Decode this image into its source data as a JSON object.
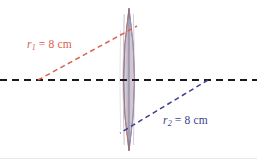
{
  "figure": {
    "background_color": "#ffffff",
    "width": 257,
    "height": 159
  },
  "optical_axis": {
    "name": "optical-axis",
    "style": "dashed",
    "color": "#1a1a1a",
    "y": 80,
    "x_start": 0,
    "x_end": 257
  },
  "lens": {
    "name": "biconvex-lens",
    "shape": "biconvex",
    "center_x": 129,
    "top_y": 8,
    "bottom_y": 151,
    "half_width": 11,
    "fill_color": "#c9c6d6",
    "left_edge_color": "#c4786e",
    "right_edge_color": "#9b93b5",
    "outline_color": "#6e6880"
  },
  "radii": [
    {
      "id": "r1",
      "label": "r",
      "subscript": "1",
      "equals": " = 8 cm",
      "value": 8,
      "unit": "cm",
      "color": "#d9604e",
      "line_style": "dashed",
      "from": {
        "x": 38,
        "y": 80
      },
      "to": {
        "x": 137,
        "y": 26
      }
    },
    {
      "id": "r2",
      "label": "r",
      "subscript": "2",
      "equals": " = 8 cm",
      "value": 8,
      "unit": "cm",
      "color": "#3b3f8c",
      "line_style": "dashed",
      "from": {
        "x": 208,
        "y": 80
      },
      "to": {
        "x": 120,
        "y": 133
      }
    }
  ]
}
